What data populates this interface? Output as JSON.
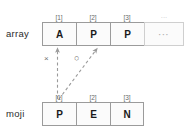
{
  "diagram": {
    "colors": {
      "cell_border": "#9b9b9b",
      "cell_border_faded": "#cfcfcf",
      "cell_fill": "#fbfbfb",
      "text": "#1a1a1a",
      "label_text": "#2b2b2b",
      "index_text": "#6a6a6a",
      "arrow": "#9a9a9a",
      "mark": "#6f6f6f"
    },
    "rows": [
      {
        "name": "array",
        "label": "array",
        "indices": [
          "[1]",
          "[2]",
          "[3]",
          "···"
        ],
        "cells": [
          {
            "value": "A",
            "faded": false
          },
          {
            "value": "P",
            "faded": false
          },
          {
            "value": "P",
            "faded": false
          },
          {
            "value": "···",
            "faded": true
          }
        ]
      },
      {
        "name": "moji",
        "label": "moji",
        "indices": [
          "[1]",
          "[2]",
          "[3]"
        ],
        "cells": [
          {
            "value": "P",
            "faded": false
          },
          {
            "value": "E",
            "faded": false
          },
          {
            "value": "N",
            "faded": false
          }
        ]
      }
    ],
    "arrows": [
      {
        "name": "mismatch-arrow",
        "from": "moji[1]",
        "to": "array[1]",
        "style": "dashed",
        "mark": "×"
      },
      {
        "name": "match-arrow",
        "from": "moji[1]",
        "to": "array[2]",
        "style": "dashed",
        "mark": "○"
      }
    ],
    "marks": {
      "cross": "×",
      "circle": "○"
    }
  }
}
